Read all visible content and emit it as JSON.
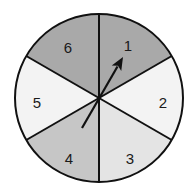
{
  "spinner": {
    "center": [
      99,
      98
    ],
    "radius": 84,
    "outline_color": "#111111",
    "sectors": [
      {
        "label": "1",
        "start_deg": -90,
        "end_deg": -30,
        "fill": "#a9a9a9",
        "label_pos": [
          128,
          47
        ]
      },
      {
        "label": "2",
        "start_deg": -30,
        "end_deg": 30,
        "fill": "#f3f3f3",
        "label_pos": [
          163,
          104
        ]
      },
      {
        "label": "3",
        "start_deg": 30,
        "end_deg": 90,
        "fill": "#e4e4e4",
        "label_pos": [
          130,
          160
        ]
      },
      {
        "label": "4",
        "start_deg": 90,
        "end_deg": 150,
        "fill": "#c6c6c6",
        "label_pos": [
          69,
          160
        ]
      },
      {
        "label": "5",
        "start_deg": 150,
        "end_deg": 210,
        "fill": "#f3f3f3",
        "label_pos": [
          37,
          104
        ]
      },
      {
        "label": "6",
        "start_deg": 210,
        "end_deg": 270,
        "fill": "#a9a9a9",
        "label_pos": [
          68,
          49
        ]
      }
    ],
    "arrow": {
      "tail": [
        82,
        128
      ],
      "tip": [
        123,
        57
      ],
      "color": "#111111",
      "pointing_to": "1"
    }
  }
}
